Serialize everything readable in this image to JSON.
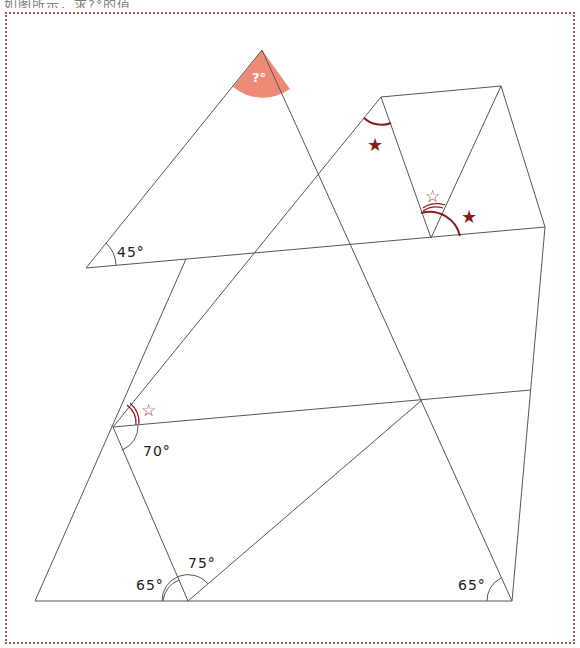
{
  "caption": "如图所示，求?°的值",
  "figure": {
    "unknown_label": "?°",
    "angles": [
      {
        "id": "top",
        "label": "?°"
      },
      {
        "id": "left",
        "label": "45°"
      },
      {
        "id": "mid-left",
        "label": "70°"
      },
      {
        "id": "bottom-left",
        "label": "65°"
      },
      {
        "id": "bottom-mid",
        "label": "75°"
      },
      {
        "id": "bottom-right",
        "label": "65°"
      }
    ],
    "markers": {
      "filled_star": "★",
      "hollow_star": "☆"
    },
    "colors": {
      "line": "#555555",
      "highlight": "#f08a78",
      "marker": "#8b1a1a",
      "frame": "#a05a5a"
    }
  }
}
